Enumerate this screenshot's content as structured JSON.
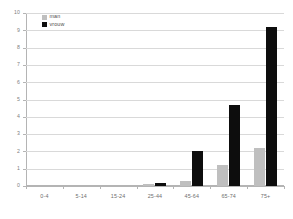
{
  "chart_data": {
    "type": "bar",
    "title": "",
    "subtitle": "",
    "xlabel": "",
    "ylabel": "",
    "categories": [
      "0-4",
      "5-14",
      "15-24",
      "25-44",
      "45-64",
      "65-74",
      "75+"
    ],
    "series": [
      {
        "name": "man",
        "color": "#bfbfbf",
        "values": [
          0,
          0,
          0,
          0.1,
          0.3,
          1.2,
          2.2
        ]
      },
      {
        "name": "vrouw",
        "color": "#0d0d0d",
        "values": [
          0,
          0,
          0,
          0.15,
          2.0,
          4.7,
          9.2
        ]
      }
    ],
    "ylim": [
      0,
      10
    ],
    "ytick_step": 1,
    "yticks": [
      0,
      1,
      2,
      3,
      4,
      5,
      6,
      7,
      8,
      9,
      10
    ],
    "ytick_labels": [
      "0",
      "1",
      "2",
      "3",
      "4",
      "5",
      "6",
      "7",
      "8",
      "9",
      "10"
    ],
    "grid": true,
    "grid_axis": "y",
    "grid_color": "#d9d9d9",
    "axis_color": "#b4b4b4",
    "legend_position": "top-left",
    "legend": [
      {
        "label": "man",
        "color": "#bfbfbf"
      },
      {
        "label": "vrouw",
        "color": "#0d0d0d"
      }
    ]
  }
}
